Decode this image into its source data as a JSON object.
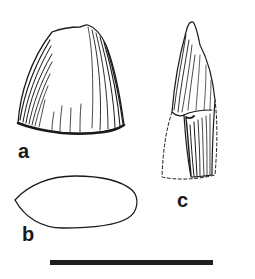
{
  "figure": {
    "panels": [
      {
        "id": "a",
        "label": "a",
        "description": "tooth crown, lateral view, broad bell shape with longitudinal striations"
      },
      {
        "id": "b",
        "label": "b",
        "description": "tooth cross-section outline, elongate oval with pointed end"
      },
      {
        "id": "c",
        "label": "c",
        "description": "tooth, lateral view, conical crown with dashed reconstructed outline at base"
      }
    ],
    "scale_bar": {
      "visible": true
    }
  },
  "colors": {
    "ink": "#1a1a1a",
    "background": "#ffffff"
  }
}
